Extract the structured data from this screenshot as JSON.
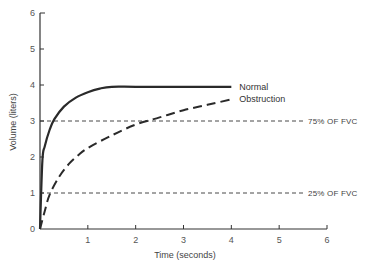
{
  "chart_data": {
    "type": "line",
    "title": "",
    "xlabel": "Time (seconds)",
    "ylabel": "Volume (liters)",
    "xlim": [
      0,
      6
    ],
    "ylim": [
      0,
      6
    ],
    "x_ticks": [
      "1",
      "2",
      "3",
      "4",
      "5",
      "6"
    ],
    "y_ticks": [
      "0",
      "1",
      "2",
      "3",
      "4",
      "5",
      "6"
    ],
    "grid": false,
    "legend": "inline labels at line ends",
    "series": [
      {
        "name": "Normal",
        "style": "solid",
        "x": [
          0,
          0.05,
          0.1,
          0.2,
          0.3,
          0.5,
          0.75,
          1.0,
          1.25,
          1.5,
          2.0,
          3.0,
          4.0
        ],
        "values": [
          0,
          1.9,
          2.3,
          2.75,
          3.05,
          3.4,
          3.65,
          3.8,
          3.9,
          3.95,
          3.95,
          3.95,
          3.95
        ]
      },
      {
        "name": "Obstruction",
        "style": "dashed",
        "x": [
          0,
          0.1,
          0.2,
          0.4,
          0.6,
          0.8,
          1.0,
          1.5,
          2.0,
          2.5,
          3.0,
          3.5,
          4.0
        ],
        "values": [
          0,
          0.5,
          0.95,
          1.45,
          1.8,
          2.05,
          2.25,
          2.6,
          2.9,
          3.1,
          3.3,
          3.45,
          3.6
        ]
      }
    ],
    "reference_lines": [
      {
        "label": "75% OF FVC",
        "y": 3,
        "style": "dashed"
      },
      {
        "label": "25% OF FVC",
        "y": 1,
        "style": "dashed"
      }
    ]
  }
}
